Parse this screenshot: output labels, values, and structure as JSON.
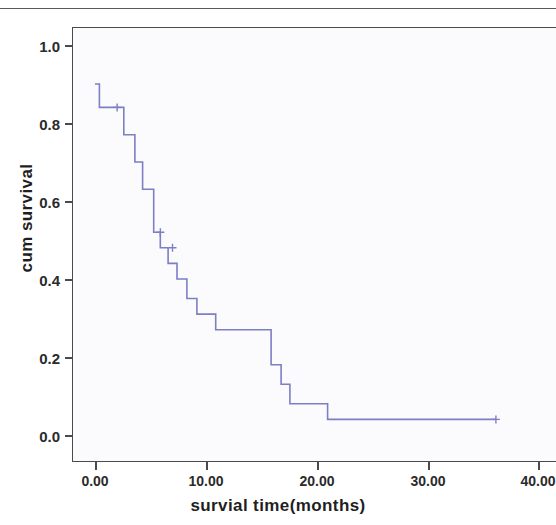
{
  "figure": {
    "kind": "kaplan-meier-survival-plot",
    "background_color": "#ffffff",
    "panel_color": "#fbfbfd",
    "frame_color": "#4a4a4a",
    "curve_color": "#7b7fc4"
  },
  "axes": {
    "x_title": "survial time(months)",
    "y_title": "cum survival",
    "x_ticks": [
      "0.00",
      "10.00",
      "20.00",
      "30.00",
      "40.00"
    ],
    "y_ticks": [
      "1.0",
      "0.8",
      "0.6",
      "0.4",
      "0.2",
      "0.0"
    ]
  },
  "chart_data": {
    "type": "line",
    "title": "",
    "subtitle": "",
    "xlabel": "survial time(months)",
    "ylabel": "cum survival",
    "xlim": [
      -2.0,
      43.7
    ],
    "ylim": [
      -0.06,
      1.08
    ],
    "x_ticks": [
      0,
      10,
      20,
      30,
      40
    ],
    "x_tick_labels": [
      "0.00",
      "10.00",
      "20.00",
      "30.00",
      "40.00"
    ],
    "y_ticks": [
      0.0,
      0.2,
      0.4,
      0.6,
      0.8,
      1.0
    ],
    "y_tick_labels": [
      "0.0",
      "0.2",
      "0.4",
      "0.6",
      "0.8",
      "1.0"
    ],
    "grid": false,
    "legend": false,
    "legend_position": "none",
    "line_style": "step-post",
    "series": [
      {
        "name": "cum survival",
        "color": "#7b7fc4",
        "x": [
          0.0,
          0.4,
          2.6,
          3.6,
          4.3,
          5.3,
          5.9,
          6.6,
          7.4,
          8.3,
          9.2,
          10.0,
          10.9,
          11.7,
          12.2,
          15.9,
          16.8,
          17.6,
          18.6,
          21.0,
          36.2
        ],
        "y": [
          0.9,
          0.84,
          0.77,
          0.7,
          0.63,
          0.52,
          0.48,
          0.44,
          0.4,
          0.35,
          0.31,
          0.31,
          0.27,
          0.27,
          0.27,
          0.18,
          0.13,
          0.08,
          0.08,
          0.04,
          0.04
        ]
      }
    ],
    "censored_points": [
      {
        "x": 2.0,
        "y": 0.84
      },
      {
        "x": 5.9,
        "y": 0.52
      },
      {
        "x": 7.0,
        "y": 0.48
      },
      {
        "x": 36.2,
        "y": 0.04
      }
    ]
  }
}
